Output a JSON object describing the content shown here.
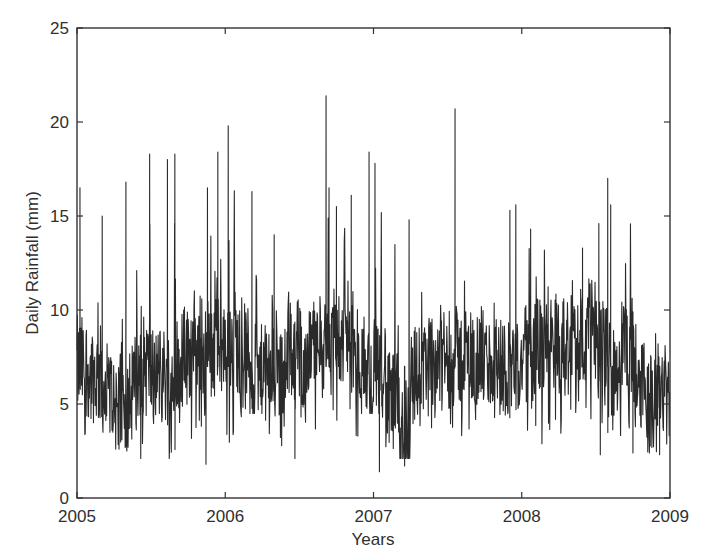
{
  "chart_data": {
    "type": "line",
    "title": "",
    "xlabel": "Years",
    "ylabel": "Daily Rainfall (mm)",
    "xlim": [
      2005,
      2009
    ],
    "ylim": [
      0,
      25
    ],
    "x_ticks": [
      "2005",
      "2006",
      "2007",
      "2008",
      "2009"
    ],
    "y_ticks": [
      "0",
      "5",
      "10",
      "15",
      "20",
      "25"
    ],
    "grid": false,
    "legend": null,
    "line_color": "#2a2a2a",
    "series": [
      {
        "name": "Daily Rainfall",
        "resolution": "daily (approximated by monthly envelope + notable spikes)",
        "monthly_envelope": {
          "months": [
            "2005-01",
            "2005-02",
            "2005-03",
            "2005-04",
            "2005-05",
            "2005-06",
            "2005-07",
            "2005-08",
            "2005-09",
            "2005-10",
            "2005-11",
            "2005-12",
            "2006-01",
            "2006-02",
            "2006-03",
            "2006-04",
            "2006-05",
            "2006-06",
            "2006-07",
            "2006-08",
            "2006-09",
            "2006-10",
            "2006-11",
            "2006-12",
            "2007-01",
            "2007-02",
            "2007-03",
            "2007-04",
            "2007-05",
            "2007-06",
            "2007-07",
            "2007-08",
            "2007-09",
            "2007-10",
            "2007-11",
            "2007-12",
            "2008-01",
            "2008-02",
            "2008-03",
            "2008-04",
            "2008-05",
            "2008-06",
            "2008-07",
            "2008-08",
            "2008-09",
            "2008-10",
            "2008-11",
            "2008-12"
          ],
          "max": [
            16.5,
            15.0,
            9.5,
            11.5,
            16.8,
            18.3,
            18.1,
            18.3,
            12.8,
            12.5,
            16.5,
            18.4,
            19.8,
            12.0,
            16.3,
            14.0,
            11.5,
            12.2,
            13.0,
            15.2,
            21.4,
            16.5,
            16.1,
            12.0,
            18.4,
            17.8,
            12.0,
            14.8,
            10.5,
            13.5,
            12.0,
            14.1,
            20.7,
            11.8,
            12.5,
            11.8,
            15.3,
            15.6,
            14.3,
            11.2,
            13.3,
            12.6,
            13.5,
            14.8,
            17.0,
            11.5,
            10.5,
            11.8
          ],
          "min": [
            3.0,
            4.0,
            3.5,
            2.6,
            2.3,
            2.0,
            3.5,
            2.1,
            4.0,
            3.0,
            3.5,
            1.8,
            2.6,
            3.6,
            4.5,
            3.4,
            2.1,
            4.0,
            3.3,
            3.5,
            4.5,
            3.2,
            3.2,
            4.5,
            4.0,
            1.4,
            2.1,
            1.7,
            2.8,
            3.5,
            3.0,
            3.0,
            4.0,
            3.8,
            2.5,
            3.5,
            3.2,
            2.8,
            3.2,
            3.3,
            4.0,
            3.5,
            3.2,
            2.3,
            3.0,
            2.5,
            2.4,
            2.3
          ],
          "mean": [
            7.0,
            6.5,
            5.5,
            5.0,
            6.0,
            7.0,
            6.5,
            6.5,
            7.5,
            8.0,
            8.0,
            8.0,
            8.5,
            7.5,
            6.5,
            6.5,
            6.5,
            8.0,
            7.5,
            8.0,
            9.0,
            8.5,
            7.5,
            6.5,
            7.0,
            5.0,
            4.0,
            6.5,
            7.0,
            7.5,
            7.5,
            7.5,
            7.5,
            7.0,
            7.0,
            7.0,
            7.5,
            8.0,
            8.5,
            8.0,
            8.5,
            9.0,
            7.5,
            7.0,
            8.0,
            6.5,
            5.0,
            6.0
          ]
        },
        "notable_peaks": [
          {
            "x": 2005.02,
            "y": 16.5
          },
          {
            "x": 2005.17,
            "y": 15.0
          },
          {
            "x": 2005.33,
            "y": 16.8
          },
          {
            "x": 2005.49,
            "y": 18.3
          },
          {
            "x": 2005.61,
            "y": 18.0
          },
          {
            "x": 2005.66,
            "y": 18.3
          },
          {
            "x": 2005.88,
            "y": 16.5
          },
          {
            "x": 2005.95,
            "y": 18.4
          },
          {
            "x": 2006.02,
            "y": 19.8
          },
          {
            "x": 2006.18,
            "y": 16.3
          },
          {
            "x": 2006.33,
            "y": 14.0
          },
          {
            "x": 2006.68,
            "y": 21.4
          },
          {
            "x": 2006.7,
            "y": 16.5
          },
          {
            "x": 2006.75,
            "y": 15.5
          },
          {
            "x": 2006.85,
            "y": 16.1
          },
          {
            "x": 2006.97,
            "y": 18.4
          },
          {
            "x": 2007.01,
            "y": 17.8
          },
          {
            "x": 2007.24,
            "y": 14.8
          },
          {
            "x": 2007.55,
            "y": 20.7
          },
          {
            "x": 2007.92,
            "y": 15.3
          },
          {
            "x": 2007.96,
            "y": 15.6
          },
          {
            "x": 2008.06,
            "y": 14.3
          },
          {
            "x": 2008.41,
            "y": 13.3
          },
          {
            "x": 2008.52,
            "y": 14.6
          },
          {
            "x": 2008.58,
            "y": 17.0
          },
          {
            "x": 2008.6,
            "y": 15.6
          }
        ],
        "notable_troughs": [
          {
            "x": 2005.43,
            "y": 2.1
          },
          {
            "x": 2005.87,
            "y": 1.8
          },
          {
            "x": 2006.47,
            "y": 2.1
          },
          {
            "x": 2007.04,
            "y": 1.4
          },
          {
            "x": 2007.21,
            "y": 1.7
          },
          {
            "x": 2008.53,
            "y": 2.3
          },
          {
            "x": 2008.75,
            "y": 2.4
          },
          {
            "x": 2008.93,
            "y": 2.3
          }
        ],
        "overall_range": [
          1.4,
          21.4
        ],
        "typical_band": [
          4,
          11
        ]
      }
    ]
  }
}
